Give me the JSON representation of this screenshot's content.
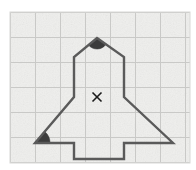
{
  "figure": {
    "kind": "geometry-diagram",
    "canvas": {
      "width": 196,
      "height": 170
    },
    "background_color": "#ffffff",
    "paper": {
      "name": "grid-paper",
      "x": 10,
      "y": 12,
      "width": 180,
      "height": 151,
      "fill_color": "#f2f2f0",
      "border_color": "#d8d8d6",
      "noise_opacity": 0.35
    },
    "grid": {
      "visible": true,
      "spacing": 25,
      "minor_spacing": 25,
      "line_color": "#c9c9c7",
      "line_width": 1,
      "vertical_lines": [
        10,
        35,
        60,
        85,
        110,
        135,
        160,
        185
      ],
      "horizontal_lines": [
        12,
        37,
        62,
        87,
        112,
        137,
        162
      ]
    },
    "outline": {
      "name": "rocket-outline",
      "stroke_color": "#5a5a5a",
      "stroke_width": 2.4,
      "fill_color": "none",
      "closed": true,
      "points": [
        [
          97,
          38
        ],
        [
          124,
          57
        ],
        [
          124,
          97
        ],
        [
          173,
          143
        ],
        [
          124,
          143
        ],
        [
          124,
          159
        ],
        [
          74,
          159
        ],
        [
          74,
          143
        ],
        [
          35,
          143
        ],
        [
          74,
          97
        ],
        [
          74,
          57
        ]
      ],
      "points_label": "apex, upper-right-shoulder, right-body-corner, right-wing-tip, right-wing-inner, right-nozzle-outer, left-nozzle-outer, left-wing-inner, left-wing-tip, left-body-corner, upper-left-shoulder"
    },
    "angle_markers": [
      {
        "name": "apex-angle-marker",
        "type": "filled-sector",
        "vertex_x": 97,
        "vertex_y": 38,
        "radius": 11,
        "fill_color": "#3c3c3c",
        "description": "shaded angle at the nose vertex"
      },
      {
        "name": "left-wing-angle-marker",
        "type": "filled-sector",
        "vertex_x": 35,
        "vertex_y": 143,
        "radius": 15,
        "fill_color": "#3c3c3c",
        "description": "shaded angle at the left wing tip"
      }
    ],
    "center_mark": {
      "name": "center-cross-mark",
      "symbol": "×",
      "x": 97,
      "y": 97,
      "size": 9,
      "color": "#1a1a1a",
      "stroke_width": 1.6,
      "description": "small x marking the centre of the figure"
    }
  }
}
